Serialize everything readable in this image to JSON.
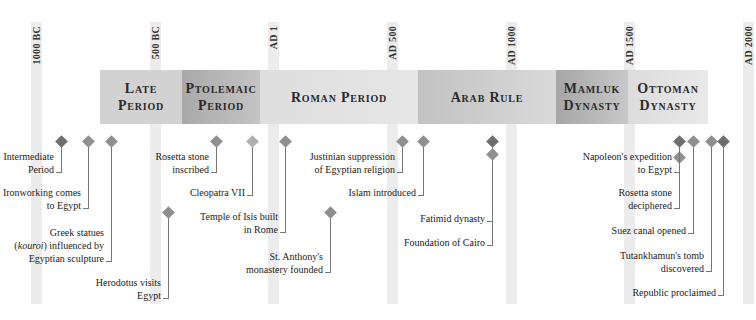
{
  "colors": {
    "axis_bar": "#ececec",
    "diamond_dark": "#6e6e6e",
    "diamond_mid": "#8f8f8f",
    "diamond_light": "#b0b0b0",
    "stem": "#777777"
  },
  "axis": {
    "ticks": [
      {
        "label": "1000 BC",
        "x": 31
      },
      {
        "label": "500 BC",
        "x": 150
      },
      {
        "label": "AD 1",
        "x": 268
      },
      {
        "label": "AD 500",
        "x": 387
      },
      {
        "label": "AD 1000",
        "x": 506
      },
      {
        "label": "AD 1500",
        "x": 624
      },
      {
        "label": "AD 2000",
        "x": 743
      }
    ]
  },
  "periods": [
    {
      "line1": "Late",
      "line2": "Period",
      "start": 100,
      "end": 182,
      "style": "late"
    },
    {
      "line1": "Ptolemaic",
      "line2": "Period",
      "start": 182,
      "end": 260,
      "style": "ptol"
    },
    {
      "line1": "Roman Period",
      "line2": "",
      "start": 260,
      "end": 418,
      "style": "roman"
    },
    {
      "line1": "Arab Rule",
      "line2": "",
      "start": 418,
      "end": 556,
      "style": "arab"
    },
    {
      "line1": "Mamluk",
      "line2": "Dynasty",
      "start": 556,
      "end": 628,
      "style": "mamluk"
    },
    {
      "line1": "Ottoman",
      "line2": "Dynasty",
      "start": 628,
      "end": 708,
      "style": "ottoman"
    }
  ],
  "events": [
    {
      "lines": [
        "Intermediate",
        "Period"
      ],
      "x": 61,
      "label_top": 150,
      "shade": "dark"
    },
    {
      "lines": [
        "Ironworking comes",
        "to Egypt"
      ],
      "x": 88,
      "label_top": 186,
      "shade": "mid"
    },
    {
      "lines": [
        "Greek statues",
        "(kouroi) influenced by",
        "Egyptian sculpture"
      ],
      "x": 111,
      "label_top": 226,
      "shade": "mid"
    },
    {
      "lines": [
        "Herodotus visits",
        "Egypt"
      ],
      "x": 168,
      "label_top": 276,
      "shade": "mid",
      "diamond_top": 208
    },
    {
      "lines": [
        "Rosetta stone",
        "inscribed"
      ],
      "x": 216,
      "label_top": 150,
      "shade": "mid"
    },
    {
      "lines": [
        "Cleopatra VII"
      ],
      "x": 252,
      "label_top": 186,
      "shade": "light"
    },
    {
      "lines": [
        "Temple of Isis built",
        "in Rome"
      ],
      "x": 285,
      "label_top": 210,
      "shade": "mid"
    },
    {
      "lines": [
        "St. Anthony's",
        "monastery founded"
      ],
      "x": 330,
      "label_top": 250,
      "shade": "mid",
      "diamond_top": 208
    },
    {
      "lines": [
        "Justinian suppression",
        "of Egyptian religion"
      ],
      "x": 402,
      "label_top": 150,
      "shade": "mid"
    },
    {
      "lines": [
        "Islam introduced"
      ],
      "x": 423,
      "label_top": 186,
      "shade": "mid"
    },
    {
      "lines": [
        "Fatimid dynasty"
      ],
      "x": 492,
      "label_top": 212,
      "shade": "dark"
    },
    {
      "lines": [
        "Foundation of Cairo"
      ],
      "x": 492,
      "label_top": 236,
      "shade": "mid",
      "diamond_top": 150
    },
    {
      "lines": [
        "Napoleon's expedition",
        "to Egypt"
      ],
      "x": 679,
      "label_top": 150,
      "shade": "mid",
      "diamond_top": 153
    },
    {
      "lines": [
        "Rosetta stone",
        "deciphered"
      ],
      "x": 679,
      "label_top": 186,
      "shade": "dark"
    },
    {
      "lines": [
        "Suez canal opened"
      ],
      "x": 693,
      "label_top": 224,
      "shade": "mid"
    },
    {
      "lines": [
        "Tutankhamun's tomb",
        "discovered"
      ],
      "x": 711,
      "label_top": 249,
      "shade": "mid"
    },
    {
      "lines": [
        "Republic proclaimed"
      ],
      "x": 723,
      "label_top": 286,
      "shade": "dark"
    }
  ]
}
